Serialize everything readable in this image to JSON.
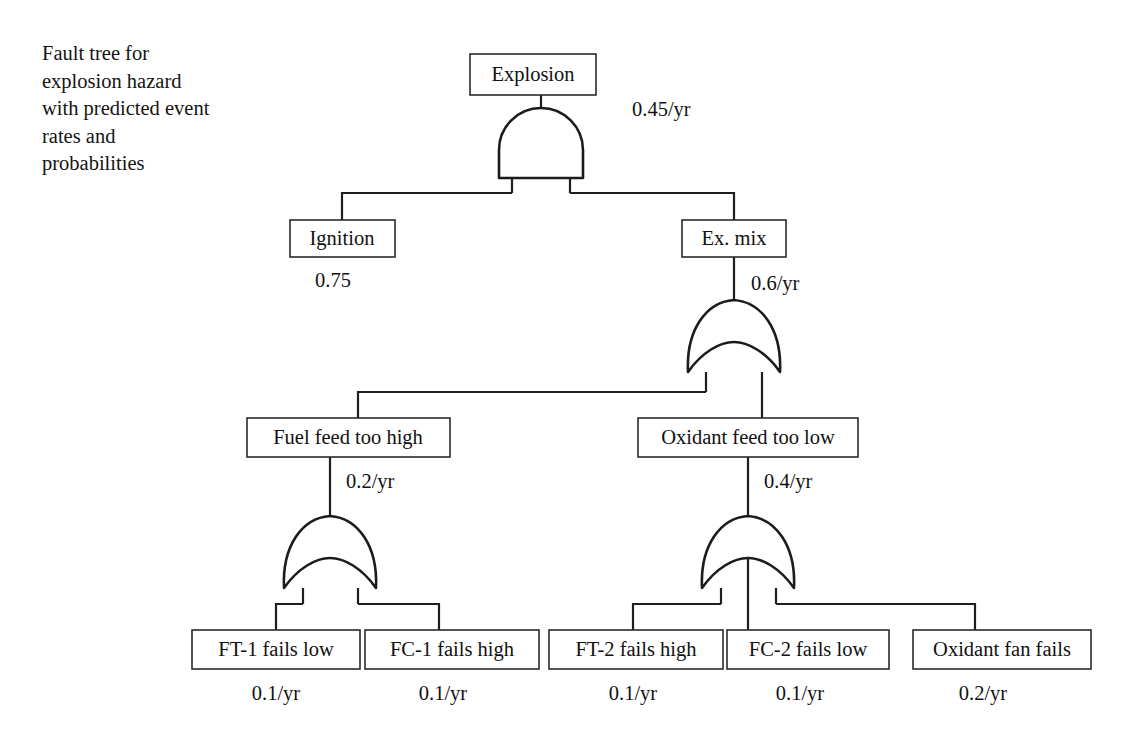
{
  "caption": "Fault tree for\nexplosion hazard\nwith predicted event\nrates and\nprobabilities",
  "diagram": {
    "type": "fault-tree",
    "title": "Fault tree for explosion hazard with predicted event rates and probabilities"
  },
  "nodes": {
    "explosion": {
      "label": "Explosion",
      "rate": "0.45/yr"
    },
    "ignition": {
      "label": "Ignition",
      "rate": "0.75"
    },
    "ex_mix": {
      "label": "Ex. mix",
      "rate": "0.6/yr"
    },
    "fuel_feed": {
      "label": "Fuel feed too high",
      "rate": "0.2/yr"
    },
    "oxidant_feed": {
      "label": "Oxidant feed too low",
      "rate": "0.4/yr"
    },
    "ft1": {
      "label": "FT-1 fails low",
      "rate": "0.1/yr"
    },
    "fc1": {
      "label": "FC-1 fails high",
      "rate": "0.1/yr"
    },
    "ft2": {
      "label": "FT-2 fails high",
      "rate": "0.1/yr"
    },
    "fc2": {
      "label": "FC-2 fails low",
      "rate": "0.1/yr"
    },
    "oxidant_fan": {
      "label": "Oxidant fan fails",
      "rate": "0.2/yr"
    }
  },
  "gates": {
    "top": {
      "kind": "AND",
      "output": "explosion",
      "inputs": [
        "ignition",
        "ex_mix"
      ]
    },
    "ex_mix_gate": {
      "kind": "OR",
      "output": "ex_mix",
      "inputs": [
        "fuel_feed",
        "oxidant_feed"
      ]
    },
    "fuel_gate": {
      "kind": "OR",
      "output": "fuel_feed",
      "inputs": [
        "ft1",
        "fc1"
      ]
    },
    "oxidant_gate": {
      "kind": "OR",
      "output": "oxidant_feed",
      "inputs": [
        "ft2",
        "fc2",
        "oxidant_fan"
      ]
    }
  },
  "colors": {
    "line": "#1e1e1e",
    "box_stroke": "#2b2b2b",
    "text": "#111111",
    "background": "#ffffff"
  }
}
